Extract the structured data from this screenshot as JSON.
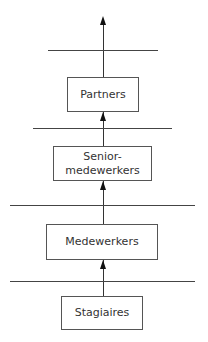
{
  "diagram": {
    "type": "hierarchy-ladder",
    "levels": [
      {
        "label": "Partners"
      },
      {
        "label": "Senior-\nmedewerkers",
        "line1": "Senior-",
        "line2": "medewerkers"
      },
      {
        "label": "Medewerkers"
      },
      {
        "label": "Stagiaires"
      }
    ],
    "arrow_direction": "up"
  }
}
